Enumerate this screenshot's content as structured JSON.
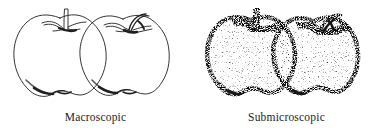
{
  "figure": {
    "background_color": "#ffffff",
    "ink_color": "#1a1a1a",
    "stipple_color": "#555555",
    "panels": [
      {
        "id": "macroscopic",
        "caption": "Macroscopic",
        "render_style": "line-art",
        "subject": "two apples with stems, continuous outline drawing",
        "apple_count": 2
      },
      {
        "id": "submicroscopic",
        "caption": "Submicroscopic",
        "render_style": "stippled-dots",
        "subject": "two apples with stems, rendered as scattered particles",
        "apple_count": 2
      }
    ]
  }
}
